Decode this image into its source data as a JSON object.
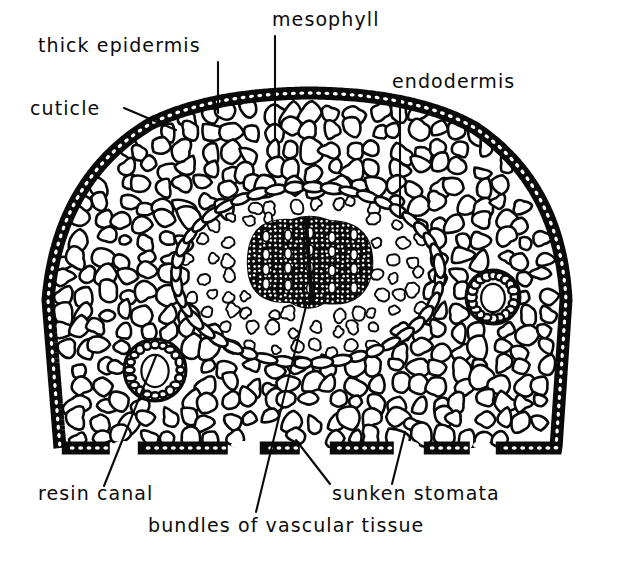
{
  "figure": {
    "kind": "botanical-cross-section-diagram",
    "background_color": "#ffffff",
    "ink_color": "#0a0a0a"
  },
  "labels": [
    {
      "id": "thick-epidermis",
      "text": "thick epidermis",
      "x": 38,
      "y": 52,
      "anchor": "start",
      "leader": {
        "type": "line",
        "x1": 218,
        "y1": 62,
        "x2": 218,
        "y2": 113
      }
    },
    {
      "id": "mesophyll",
      "text": "mesophyll",
      "x": 272,
      "y": 26,
      "anchor": "start",
      "leader": {
        "type": "line",
        "x1": 275,
        "y1": 36,
        "x2": 275,
        "y2": 140
      }
    },
    {
      "id": "endodermis",
      "text": "endodermis",
      "x": 392,
      "y": 88,
      "anchor": "start",
      "leader": {
        "type": "line",
        "x1": 400,
        "y1": 97,
        "x2": 400,
        "y2": 218
      }
    },
    {
      "id": "cuticle",
      "text": "cuticle",
      "x": 30,
      "y": 115,
      "anchor": "start",
      "leader": {
        "type": "line",
        "x1": 124,
        "y1": 108,
        "x2": 176,
        "y2": 130
      }
    },
    {
      "id": "resin-canal",
      "text": "resin canal",
      "x": 38,
      "y": 500,
      "anchor": "start",
      "leader": {
        "type": "line",
        "x1": 156,
        "y1": 356,
        "x2": 104,
        "y2": 486
      }
    },
    {
      "id": "bundles-of-vascular-tissue",
      "text": "bundles of vascular tissue",
      "x": 148,
      "y": 532,
      "anchor": "start",
      "leader": {
        "type": "line",
        "x1": 307,
        "y1": 302,
        "x2": 256,
        "y2": 512
      }
    },
    {
      "id": "sunken-stomata",
      "text": "sunken stomata",
      "x": 332,
      "y": 500,
      "anchor": "start",
      "leader": {
        "type": "line",
        "x1": 296,
        "y1": 440,
        "x2": 330,
        "y2": 484
      },
      "leader2": {
        "type": "line",
        "x1": 405,
        "y1": 432,
        "x2": 392,
        "y2": 484
      }
    }
  ],
  "structures": {
    "outline": {
      "name": "leaf-section-outline",
      "description": "semicircular dome above, slanted flanks, flat base",
      "path": "M 60 448 L 48 300 Q 58 180 150 124 Q 210 94 310 93 Q 415 94 475 128 Q 560 185 566 300 L 556 448 Z"
    },
    "epidermis": {
      "name": "thick-epidermis-band",
      "thickness": 13
    },
    "cuticle": {
      "name": "cuticle-layer",
      "thickness": 4
    },
    "endodermis_ring": {
      "name": "endodermis-ring",
      "cx": 308,
      "cy": 275,
      "rx": 132,
      "ry": 88
    },
    "stele": {
      "name": "vascular-stele",
      "cx": 310,
      "cy": 262,
      "rx": 62,
      "ry": 42
    },
    "resin_canals": [
      {
        "name": "resin-canal-left",
        "cx": 155,
        "cy": 370,
        "r": 31
      },
      {
        "name": "resin-canal-right",
        "cx": 493,
        "cy": 297,
        "r": 27
      }
    ],
    "stomata_gaps": [
      {
        "name": "stoma-gap-1",
        "x": 110,
        "width": 26
      },
      {
        "name": "stoma-gap-2",
        "x": 228,
        "width": 30
      },
      {
        "name": "stoma-gap-3",
        "x": 300,
        "width": 28
      },
      {
        "name": "stoma-gap-4",
        "x": 394,
        "width": 28
      },
      {
        "name": "stoma-gap-5",
        "x": 470,
        "width": 24
      }
    ]
  }
}
